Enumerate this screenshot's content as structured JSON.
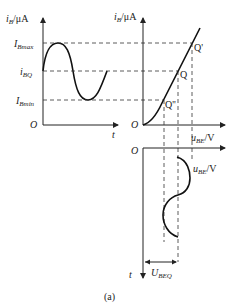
{
  "figure": {
    "caption": "(a)",
    "input_waveform": {
      "y_axis_label_main": "i",
      "y_axis_label_sub": "B",
      "y_axis_unit": "/μA",
      "x_axis_label": "t",
      "origin": "O",
      "levels": [
        {
          "main": "I",
          "sub": "Bmax"
        },
        {
          "main": "i",
          "sub": "BQ"
        },
        {
          "main": "I",
          "sub": "Bmin"
        }
      ]
    },
    "characteristic": {
      "y_axis_label_main": "i",
      "y_axis_label_sub": "B",
      "y_axis_unit": "/μA",
      "x_axis_label_main": "u",
      "x_axis_label_sub": "BE",
      "x_axis_unit": "/V",
      "origin": "O",
      "points": [
        "Q'",
        "Q",
        "Q''"
      ]
    },
    "output_waveform": {
      "x_axis_label_main": "u",
      "x_axis_label_sub": "BE",
      "x_axis_unit": "/V",
      "t_axis_label": "t",
      "origin": "O",
      "dc_label_main": "U",
      "dc_label_sub": "BEQ"
    }
  }
}
